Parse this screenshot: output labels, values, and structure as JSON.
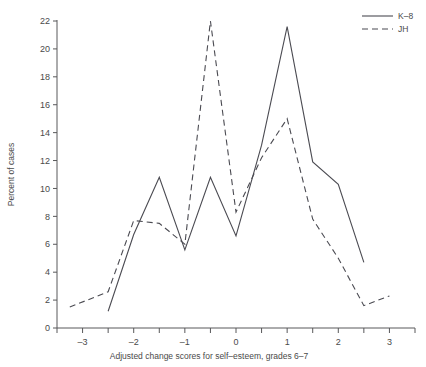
{
  "chart_data": {
    "type": "line",
    "title": "",
    "xlabel": "Adjusted change scores for self-esteem, grades 6-7",
    "ylabel": "Percent of cases",
    "xlim": [
      -3.5,
      3.5
    ],
    "ylim": [
      0,
      23
    ],
    "grid": false,
    "legend_position": "top-right",
    "xticks": [
      -3.5,
      -3,
      -2.5,
      -2,
      -1.5,
      -1,
      -0.5,
      0,
      0.5,
      1,
      1.5,
      2,
      2.5,
      3,
      3.5
    ],
    "xtick_labels": [
      "",
      "-3",
      "",
      "-2",
      "",
      "-1",
      "",
      "0",
      "",
      "1",
      "",
      "2",
      "",
      "3",
      ""
    ],
    "yticks": [
      0,
      2,
      4,
      6,
      8,
      10,
      12,
      14,
      16,
      18,
      20,
      22
    ],
    "ytick_labels": [
      "0",
      "2",
      "4",
      "6",
      "8",
      "10",
      "12",
      "14",
      "16",
      "18",
      "20",
      "22"
    ],
    "series": [
      {
        "name": "K-8",
        "style": "solid",
        "color": "#4b4b52",
        "x": [
          -2.5,
          -2,
          -1.5,
          -1,
          -0.5,
          0,
          0.5,
          1,
          1.5,
          2,
          2.5
        ],
        "values": [
          1.2,
          6.7,
          10.8,
          5.6,
          10.8,
          6.6,
          13.1,
          21.6,
          11.9,
          10.3,
          4.7
        ]
      },
      {
        "name": "JH",
        "style": "dashed",
        "color": "#4b4b52",
        "x": [
          -3.25,
          -2.5,
          -2,
          -1.5,
          -1,
          -0.5,
          0,
          0.5,
          1,
          1.5,
          2,
          2.5,
          3
        ],
        "values": [
          1.5,
          2.6,
          7.7,
          7.5,
          6.0,
          22.0,
          8.3,
          12.2,
          15.0,
          7.8,
          5.0,
          1.6,
          2.3
        ]
      }
    ]
  },
  "legend": {
    "items": [
      {
        "label": "K-8",
        "style": "solid"
      },
      {
        "label": "JH",
        "style": "dashed"
      }
    ]
  }
}
